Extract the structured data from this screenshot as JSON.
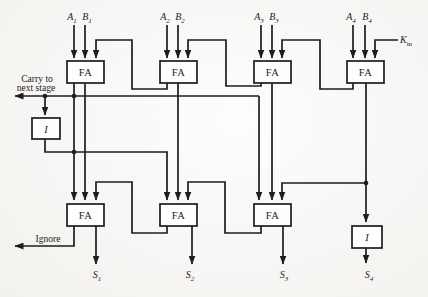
{
  "figure": {
    "colors": {
      "paper": "#fbfaf7",
      "ink": "#1d1d1d"
    },
    "stages": [
      {
        "a": {
          "base": "A",
          "sub": "1"
        },
        "b": {
          "base": "B",
          "sub": "1"
        }
      },
      {
        "a": {
          "base": "A",
          "sub": "2"
        },
        "b": {
          "base": "B",
          "sub": "2"
        }
      },
      {
        "a": {
          "base": "A",
          "sub": "3"
        },
        "b": {
          "base": "B",
          "sub": "3"
        }
      },
      {
        "a": {
          "base": "A",
          "sub": "4"
        },
        "b": {
          "base": "B",
          "sub": "4"
        }
      }
    ],
    "carry_in": {
      "base": "K",
      "sub": "in"
    },
    "adder_label": "FA",
    "inverter_label": "I",
    "carry_out_note": {
      "line1": "Carry to",
      "line2": "next stage"
    },
    "ignore_label": "Ignore",
    "sums": [
      {
        "base": "S",
        "sub": "1"
      },
      {
        "base": "S",
        "sub": "2"
      },
      {
        "base": "S",
        "sub": "3"
      },
      {
        "base": "S",
        "sub": "4"
      }
    ]
  }
}
